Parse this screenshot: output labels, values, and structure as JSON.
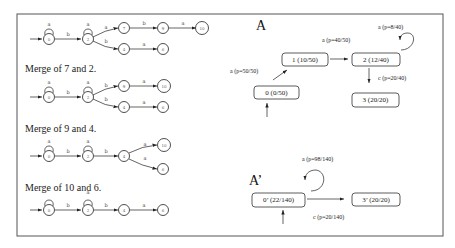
{
  "left_panel": {
    "captions": [
      "Merge of 7 and 2.",
      "Merge of 9 and 4.",
      "Merge of 10 and 6."
    ],
    "stray_label": "a",
    "automata": [
      {
        "nodes": [
          "0",
          "2",
          "7",
          "9",
          "10",
          "4",
          "6"
        ],
        "edges": [
          {
            "from": "0",
            "to": "0",
            "label": "a"
          },
          {
            "from": "0",
            "to": "2",
            "label": "b"
          },
          {
            "from": "2",
            "to": "2",
            "label": "a"
          },
          {
            "from": "2",
            "to": "7",
            "label": "a"
          },
          {
            "from": "7",
            "to": "9",
            "label": "b"
          },
          {
            "from": "9",
            "to": "10",
            "label": "a"
          },
          {
            "from": "2",
            "to": "4",
            "label": "b"
          },
          {
            "from": "4",
            "to": "6",
            "label": "a"
          }
        ]
      },
      {
        "nodes": [
          "0",
          "2",
          "9",
          "10",
          "4",
          "6"
        ],
        "edges": [
          {
            "from": "0",
            "to": "0",
            "label": "a"
          },
          {
            "from": "0",
            "to": "2",
            "label": "b"
          },
          {
            "from": "2",
            "to": "2",
            "label": "a"
          },
          {
            "from": "2",
            "to": "9",
            "label": "b"
          },
          {
            "from": "9",
            "to": "10",
            "label": "a"
          },
          {
            "from": "2",
            "to": "4",
            "label": "b"
          },
          {
            "from": "4",
            "to": "6",
            "label": "a"
          }
        ]
      },
      {
        "nodes": [
          "0",
          "2",
          "4",
          "10",
          "6"
        ],
        "edges": [
          {
            "from": "0",
            "to": "0",
            "label": "a"
          },
          {
            "from": "0",
            "to": "2",
            "label": "b"
          },
          {
            "from": "2",
            "to": "2",
            "label": "a"
          },
          {
            "from": "2",
            "to": "4",
            "label": "b"
          },
          {
            "from": "4",
            "to": "10",
            "label": "a"
          },
          {
            "from": "4",
            "to": "6",
            "label": "a"
          }
        ]
      },
      {
        "nodes": [
          "0",
          "2",
          "4",
          "6"
        ],
        "edges": [
          {
            "from": "0",
            "to": "0",
            "label": ""
          },
          {
            "from": "0",
            "to": "2",
            "label": "b"
          },
          {
            "from": "2",
            "to": "2",
            "label": "a"
          },
          {
            "from": "2",
            "to": "4",
            "label": "b"
          },
          {
            "from": "4",
            "to": "6",
            "label": "a"
          }
        ]
      }
    ],
    "edge_labels": {
      "a": "a",
      "b": "b"
    }
  },
  "right_panel": {
    "A": {
      "title": "A",
      "states": {
        "s0": "0 (0/50)",
        "s1": "1 (10/50)",
        "s2": "2 (12/40)",
        "s3": "3 (20/20)"
      },
      "transitions": {
        "t01": "a (p=50/50)",
        "t12": "a (p=40/50)",
        "t22": "a (p=8/40)",
        "t23": "c (p=20/40)"
      }
    },
    "A_prime": {
      "title": "A’",
      "states": {
        "s0": "0’ (22/140)",
        "s3": "3’ (20/20)"
      },
      "transitions": {
        "t00": "a (p=98/140)",
        "t03": "c (p=20/140)"
      }
    }
  }
}
